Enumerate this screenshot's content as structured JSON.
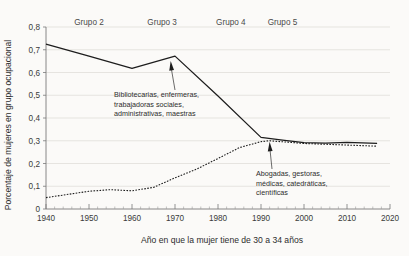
{
  "chart_data": {
    "type": "line",
    "title": "",
    "xlabel": "Año en que la mujer tiene de 30 a 34 años",
    "ylabel": "Porcentaje de mujeres en grupo ocupacional",
    "xlim": [
      1940,
      2020
    ],
    "ylim": [
      0,
      0.8
    ],
    "xticks": [
      1940,
      1950,
      1960,
      1970,
      1980,
      1990,
      2000,
      2010,
      2020
    ],
    "xtick_labels": [
      "1940",
      "1950",
      "1960",
      "1970",
      "1980",
      "1990",
      "2000",
      "2010",
      "2020"
    ],
    "x_minor_tick_step": 2,
    "yticks": [
      0,
      0.1,
      0.2,
      0.3,
      0.4,
      0.5,
      0.6,
      0.7,
      0.8
    ],
    "ytick_labels": [
      "0",
      "0,1",
      "0,2",
      "0,3",
      "0,4",
      "0,5",
      "0,6",
      "0,7",
      "0,8"
    ],
    "grid": "horizontal",
    "legend": "none",
    "series": [
      {
        "name": "Bibliotecarias, enfermeras, trabajadoras sociales, administrativas, maestras",
        "style": "solid",
        "x": [
          1940,
          1950,
          1960,
          1970,
          1980,
          1990,
          1995,
          2000,
          2005,
          2010,
          2017
        ],
        "values": [
          0.725,
          0.672,
          0.618,
          0.672,
          0.497,
          0.315,
          0.303,
          0.292,
          0.29,
          0.293,
          0.288
        ]
      },
      {
        "name": "Abogadas, gestoras, médicas, catedráticas, científicas",
        "style": "dashed",
        "x": [
          1940,
          1950,
          1955,
          1960,
          1965,
          1970,
          1975,
          1980,
          1985,
          1990,
          1992,
          2000,
          2010,
          2017
        ],
        "values": [
          0.05,
          0.078,
          0.085,
          0.08,
          0.095,
          0.137,
          0.175,
          0.222,
          0.27,
          0.296,
          0.3,
          0.288,
          0.281,
          0.276
        ]
      }
    ],
    "group_labels": [
      {
        "label": "Grupo 2",
        "x_center": 1950
      },
      {
        "label": "Grupo 3",
        "x_center": 1967
      },
      {
        "label": "Grupo 4",
        "x_center": 1983
      },
      {
        "label": "Grupo 5",
        "x_center": 1995
      }
    ],
    "annotations": [
      {
        "id": "annotation-teaching-nursing",
        "lines": [
          "Bibliotecarias, enfermeras,",
          "trabajadoras sociales,",
          "administrativas, maestras"
        ],
        "points_to_x": 1969,
        "points_to_y": 0.655
      },
      {
        "id": "annotation-professional",
        "lines": [
          "Abogadas, gestoras,",
          "médicas, catedráticas,",
          "científicas"
        ],
        "points_to_x": 1992,
        "points_to_y": 0.3
      }
    ],
    "colors": {
      "background": "#fbfaf8",
      "line": "#1d1d1d",
      "grid": "#dddad6",
      "axis": "#7a7a7a",
      "text": "#2d2d2d"
    }
  }
}
